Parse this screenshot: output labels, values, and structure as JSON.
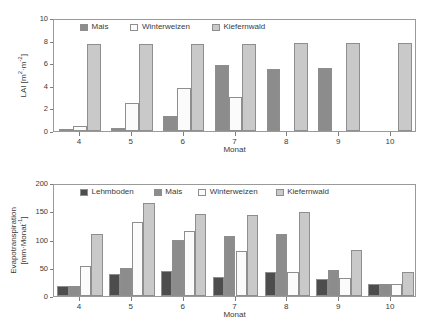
{
  "chart_data": [
    {
      "id": "lai",
      "type": "bar",
      "title": "",
      "xlabel": "Monat",
      "ylabel": "LAI [m2·m-2]",
      "ylabel_line1": "LAI [m",
      "ylabel_sup1": "2",
      "ylabel_mid": "·m",
      "ylabel_sup2": "-2",
      "ylabel_end": "]",
      "categories": [
        "4",
        "5",
        "6",
        "7",
        "8",
        "9",
        "10"
      ],
      "ylim": [
        0,
        10
      ],
      "yticks": [
        "0",
        "2",
        "4",
        "6",
        "8",
        "10"
      ],
      "grid": false,
      "legend_position": "top-left-inside",
      "series": [
        {
          "name": "Mais",
          "color": "#8c8c8c",
          "values": [
            0.05,
            0.25,
            1.35,
            5.8,
            5.45,
            5.55,
            0
          ]
        },
        {
          "name": "Winterweizen",
          "color": "#fbfbfb",
          "values": [
            0.42,
            2.5,
            3.85,
            3.05,
            0,
            0,
            0
          ]
        },
        {
          "name": "Kiefernwald",
          "color": "#c9c9c9",
          "values": [
            7.7,
            7.7,
            7.7,
            7.72,
            7.75,
            7.78,
            7.78
          ]
        }
      ]
    },
    {
      "id": "et",
      "type": "bar",
      "title": "",
      "xlabel": "Monat",
      "ylabel": "Evapotranspiration [mm·Monat-1]",
      "ylabel_line1": "Evapotranspiration",
      "ylabel_line2_a": "[mm·Monat",
      "ylabel_line2_sup": "-1",
      "ylabel_line2_b": "]",
      "categories": [
        "4",
        "5",
        "6",
        "7",
        "8",
        "9",
        "10"
      ],
      "ylim": [
        0,
        200
      ],
      "yticks": [
        "0",
        "50",
        "100",
        "150",
        "200"
      ],
      "grid": false,
      "legend_position": "top-left-inside",
      "series": [
        {
          "name": "Lehmboden",
          "color": "#4d4d4d",
          "values": [
            17,
            39,
            45,
            33,
            42,
            31,
            22
          ]
        },
        {
          "name": "Mais",
          "color": "#8c8c8c",
          "values": [
            17,
            50,
            100,
            107,
            109,
            46,
            22
          ]
        },
        {
          "name": "Winterweizen",
          "color": "#fbfbfb",
          "values": [
            54,
            131,
            115,
            79,
            42,
            32,
            22
          ]
        },
        {
          "name": "Kiefernwald",
          "color": "#c9c9c9",
          "values": [
            110,
            165,
            145,
            144,
            148,
            81,
            42
          ]
        }
      ]
    }
  ],
  "figure": {
    "background": "#ffffff",
    "axis_color": "#9a9a9a",
    "text_color": "#3a3a3a"
  }
}
